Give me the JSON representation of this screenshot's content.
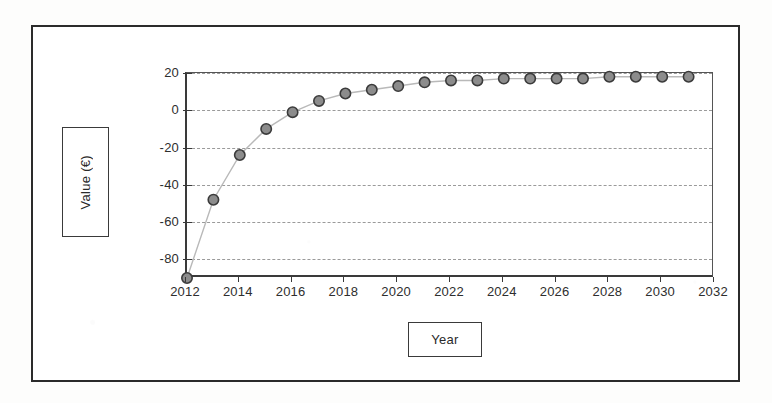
{
  "chart_data": {
    "type": "line",
    "title": "",
    "subtitle": "",
    "xlabel": "Year",
    "ylabel": "Value (€)",
    "xlim": [
      2012,
      2032
    ],
    "ylim": [
      -90,
      20
    ],
    "grid": true,
    "grid_orientation": "horizontal",
    "legend": null,
    "legend_position": "none",
    "marker": "circle",
    "marker_fill": "#8c8c8c",
    "marker_edge": "#3b3b3b",
    "line_color": "#b9b9b9",
    "x_tick_labels": [
      "2012",
      "2014",
      "2016",
      "2018",
      "2020",
      "2022",
      "2024",
      "2026",
      "2028",
      "2030",
      "2032"
    ],
    "x_tick_values": [
      2012,
      2014,
      2016,
      2018,
      2020,
      2022,
      2024,
      2026,
      2028,
      2030,
      2032
    ],
    "y_tick_labels": [
      "20",
      "0",
      "-20",
      "-40",
      "-60",
      "-80"
    ],
    "y_tick_values": [
      20,
      0,
      -20,
      -40,
      -60,
      -80
    ],
    "x": [
      2012,
      2013,
      2014,
      2015,
      2016,
      2017,
      2018,
      2019,
      2020,
      2021,
      2022,
      2023,
      2024,
      2025,
      2026,
      2027,
      2028,
      2029,
      2030,
      2031
    ],
    "values": [
      -90,
      -48,
      -24,
      -10,
      -1,
      5,
      9,
      11,
      13,
      15,
      16,
      16,
      17,
      17,
      17,
      17,
      18,
      18,
      18,
      18
    ],
    "series": [
      {
        "name": "Value",
        "x": [
          2012,
          2013,
          2014,
          2015,
          2016,
          2017,
          2018,
          2019,
          2020,
          2021,
          2022,
          2023,
          2024,
          2025,
          2026,
          2027,
          2028,
          2029,
          2030,
          2031
        ],
        "values": [
          -90,
          -48,
          -24,
          -10,
          -1,
          5,
          9,
          11,
          13,
          15,
          16,
          16,
          17,
          17,
          17,
          17,
          18,
          18,
          18,
          18
        ]
      }
    ]
  },
  "axis_titles": {
    "y": "Value (€)",
    "x": "Year"
  }
}
